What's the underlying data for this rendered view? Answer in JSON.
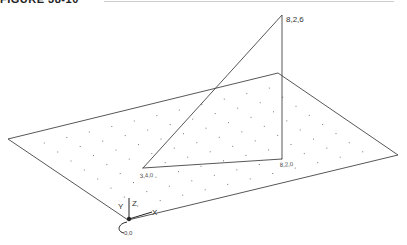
{
  "caption": {
    "text": "FIGURE 38-10"
  },
  "diagram": {
    "plane": {
      "corners": [
        [
          8,
          139
        ],
        [
          278,
          73
        ],
        [
          398,
          155
        ],
        [
          128,
          220
        ]
      ],
      "grid": "dot-grid"
    },
    "triangle": {
      "apex_label": "8,2,6",
      "left_label": "3,4,0",
      "right_label": "8,2,0"
    },
    "ucs_icon": {
      "x_label": "X",
      "y_label": "Y",
      "z_label": "Z",
      "origin_label": "0,0"
    },
    "line_color": "#444444"
  }
}
